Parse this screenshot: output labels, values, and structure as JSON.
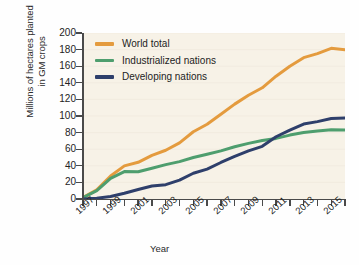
{
  "chart_data": {
    "type": "line",
    "title": "",
    "xlabel": "Year",
    "ylabel": "Millions of hectares planted in GM crops",
    "ylabel_line1": "Millions of hectares planted",
    "ylabel_line2": "in GM crops",
    "xlim": [
      1996,
      2015
    ],
    "ylim": [
      0,
      200
    ],
    "ytick_step": 20,
    "yticks": [
      0,
      20,
      40,
      60,
      80,
      100,
      120,
      140,
      160,
      180,
      200
    ],
    "xticks": [
      1996,
      1997,
      1998,
      1999,
      2000,
      2001,
      2002,
      2003,
      2004,
      2005,
      2006,
      2007,
      2008,
      2009,
      2010,
      2011,
      2012,
      2013,
      2014,
      2015
    ],
    "xtick_labels": [
      "1997",
      "1999",
      "2001",
      "2003",
      "2005",
      "2007",
      "2009",
      "2011",
      "2013",
      "2015"
    ],
    "xtick_label_years": [
      1997,
      1999,
      2001,
      2003,
      2005,
      2007,
      2009,
      2011,
      2013,
      2015
    ],
    "grid": false,
    "legend_position": "top-left",
    "x": [
      1996,
      1997,
      1998,
      1999,
      2000,
      2001,
      2002,
      2003,
      2004,
      2005,
      2006,
      2007,
      2008,
      2009,
      2010,
      2011,
      2012,
      2013,
      2014,
      2015
    ],
    "series": [
      {
        "name": "World total",
        "color": "#E49B3E",
        "values": [
          1.7,
          11,
          27.8,
          39.9,
          44.2,
          52.6,
          58.7,
          67.7,
          81,
          90,
          102,
          114.3,
          125,
          134,
          148,
          160,
          170.3,
          175.2,
          181.5,
          179.7
        ]
      },
      {
        "name": "Industrialized nations",
        "color": "#4E9E6E",
        "values": [
          1.7,
          10,
          24.8,
          33,
          32.8,
          37,
          41.4,
          45,
          50,
          54,
          58,
          63,
          67,
          70.5,
          73,
          77,
          80,
          82,
          83.5,
          83
        ]
      },
      {
        "name": "Developing nations",
        "color": "#2E3F6B",
        "values": [
          0,
          1,
          3,
          6.9,
          11.4,
          15.6,
          17.3,
          22.7,
          31,
          36,
          44,
          51.3,
          58,
          63.5,
          75,
          83,
          90.3,
          93.2,
          97,
          97.5
        ]
      }
    ]
  },
  "legend": {
    "items": [
      {
        "label": "World total",
        "color": "#E49B3E"
      },
      {
        "label": "Industrialized nations",
        "color": "#4E9E6E"
      },
      {
        "label": "Developing nations",
        "color": "#2E3F6B"
      }
    ]
  }
}
